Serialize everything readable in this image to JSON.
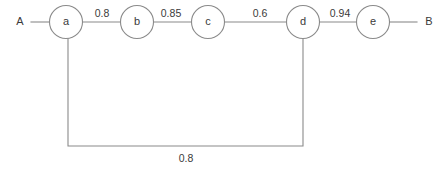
{
  "diagram": {
    "type": "graph",
    "title": "",
    "colors": {
      "stroke": "#8a8a8a",
      "text": "#3a3a3a",
      "background": "#ffffff",
      "node_fill": "#ffffff"
    },
    "terminals": [
      {
        "id": "A",
        "label": "A",
        "x": 20,
        "y": 22
      },
      {
        "id": "B",
        "label": "B",
        "x": 429,
        "y": 22
      }
    ],
    "nodes": [
      {
        "id": "a",
        "label": "a",
        "cx": 66,
        "cy": 22,
        "r": 16.5
      },
      {
        "id": "b",
        "label": "b",
        "cx": 137,
        "cy": 22,
        "r": 16.5
      },
      {
        "id": "c",
        "label": "c",
        "cx": 208,
        "cy": 22,
        "r": 16.5
      },
      {
        "id": "d",
        "label": "d",
        "cx": 303,
        "cy": 22,
        "r": 16.5
      },
      {
        "id": "e",
        "label": "e",
        "cx": 373,
        "cy": 22,
        "r": 16.5
      }
    ],
    "edges": [
      {
        "id": "edge-a-b",
        "from": "a",
        "to": "b",
        "weight": "0.8",
        "label_x": 102,
        "label_y": 17
      },
      {
        "id": "edge-b-c",
        "from": "b",
        "to": "c",
        "weight": "0.85",
        "label_x": 171,
        "label_y": 17
      },
      {
        "id": "edge-c-d",
        "from": "c",
        "to": "d",
        "weight": "0.6",
        "label_x": 260,
        "label_y": 17
      },
      {
        "id": "edge-d-e",
        "from": "d",
        "to": "e",
        "weight": "0.94",
        "label_x": 340,
        "label_y": 17
      },
      {
        "id": "edge-a-d-bottom",
        "from": "a",
        "to": "d",
        "weight": "0.8",
        "label_x": 186,
        "label_y": 162
      }
    ],
    "terminal_edges": [
      {
        "id": "edge-A-a",
        "from": "A",
        "to": "a"
      },
      {
        "id": "edge-e-B",
        "from": "e",
        "to": "B"
      }
    ]
  }
}
